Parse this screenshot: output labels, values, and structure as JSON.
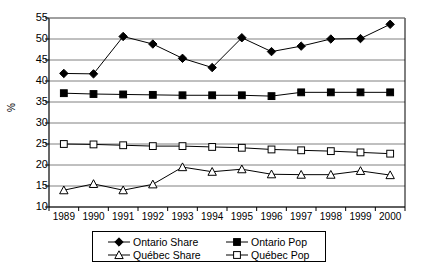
{
  "chart_data": {
    "type": "line",
    "title": "",
    "xlabel": "",
    "ylabel": "%",
    "ylim": [
      10,
      55
    ],
    "ytick_step": 5,
    "yticks": [
      10,
      15,
      20,
      25,
      30,
      35,
      40,
      45,
      50,
      55
    ],
    "grid": true,
    "grid_axis": "y",
    "legend_position": "bottom",
    "categories": [
      "1989",
      "1990",
      "1991",
      "1992",
      "1993",
      "1994",
      "1995",
      "1996",
      "1997",
      "1998",
      "1999",
      "2000"
    ],
    "series": [
      {
        "name": "Ontario Share",
        "marker": "filled-diamond",
        "color": "#000000",
        "values": [
          41.8,
          41.7,
          50.6,
          48.8,
          45.4,
          43.2,
          50.3,
          47.0,
          48.3,
          50.0,
          50.1,
          53.5
        ]
      },
      {
        "name": "Ontario Pop",
        "marker": "filled-square",
        "color": "#000000",
        "values": [
          37.1,
          36.9,
          36.8,
          36.7,
          36.6,
          36.6,
          36.6,
          36.4,
          37.3,
          37.3,
          37.3,
          37.3
        ]
      },
      {
        "name": "Québec Share",
        "marker": "open-triangle",
        "color": "#000000",
        "values": [
          14.0,
          15.5,
          14.0,
          15.4,
          19.5,
          18.4,
          19.0,
          17.8,
          17.7,
          17.7,
          18.6,
          17.6
        ]
      },
      {
        "name": "Québec Pop",
        "marker": "open-square",
        "color": "#000000",
        "values": [
          25.0,
          24.9,
          24.7,
          24.5,
          24.5,
          24.3,
          24.1,
          23.7,
          23.5,
          23.3,
          23.0,
          22.7
        ]
      }
    ]
  },
  "axis": {
    "ylabel": "%"
  },
  "legend": {
    "entries": [
      {
        "label": "Ontario Share",
        "marker": "filled-diamond"
      },
      {
        "label": "Ontario Pop",
        "marker": "filled-square"
      },
      {
        "label": "Québec Share",
        "marker": "open-triangle"
      },
      {
        "label": "Québec Pop",
        "marker": "open-square"
      }
    ]
  }
}
